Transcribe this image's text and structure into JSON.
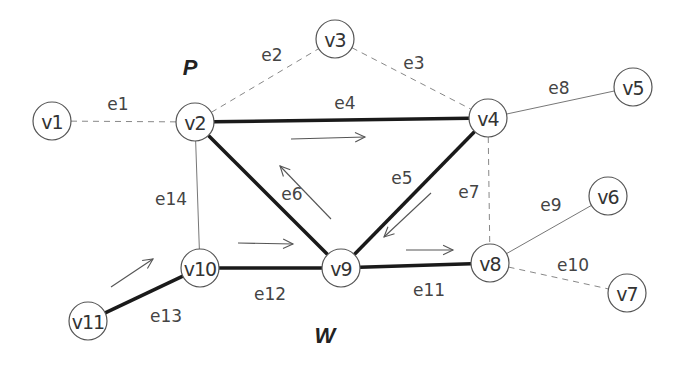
{
  "diagram": {
    "regions": [
      {
        "label": "P",
        "x": 190,
        "y": 67
      },
      {
        "label": "W",
        "x": 325,
        "y": 335
      }
    ],
    "nodes": [
      {
        "id": "v1",
        "label": "v1",
        "x": 52,
        "y": 121
      },
      {
        "id": "v2",
        "label": "v2",
        "x": 195,
        "y": 122
      },
      {
        "id": "v3",
        "label": "v3",
        "x": 335,
        "y": 39
      },
      {
        "id": "v4",
        "label": "v4",
        "x": 488,
        "y": 118
      },
      {
        "id": "v5",
        "label": "v5",
        "x": 633,
        "y": 87
      },
      {
        "id": "v6",
        "label": "v6",
        "x": 608,
        "y": 196
      },
      {
        "id": "v7",
        "label": "v7",
        "x": 627,
        "y": 293
      },
      {
        "id": "v8",
        "label": "v8",
        "x": 490,
        "y": 263
      },
      {
        "id": "v9",
        "label": "v9",
        "x": 341,
        "y": 268
      },
      {
        "id": "v10",
        "label": "v10",
        "x": 200,
        "y": 268
      },
      {
        "id": "v11",
        "label": "v11",
        "x": 88,
        "y": 321
      }
    ],
    "edges": [
      {
        "id": "e1",
        "label": "e1",
        "from": "v1",
        "to": "v2",
        "style": "dashed",
        "lx": 118,
        "ly": 104
      },
      {
        "id": "e2",
        "label": "e2",
        "from": "v2",
        "to": "v3",
        "style": "dashed",
        "lx": 272,
        "ly": 55
      },
      {
        "id": "e3",
        "label": "e3",
        "from": "v3",
        "to": "v4",
        "style": "dashed",
        "lx": 414,
        "ly": 63
      },
      {
        "id": "e4",
        "label": "e4",
        "from": "v2",
        "to": "v4",
        "style": "thick",
        "lx": 345,
        "ly": 103
      },
      {
        "id": "e5",
        "label": "e5",
        "from": "v4",
        "to": "v9",
        "style": "thick",
        "lx": 402,
        "ly": 178
      },
      {
        "id": "e6",
        "label": "e6",
        "from": "v2",
        "to": "v9",
        "style": "thick",
        "lx": 292,
        "ly": 194
      },
      {
        "id": "e7",
        "label": "e7",
        "from": "v4",
        "to": "v8",
        "style": "dashed",
        "lx": 469,
        "ly": 192
      },
      {
        "id": "e8",
        "label": "e8",
        "from": "v4",
        "to": "v5",
        "style": "thin",
        "lx": 559,
        "ly": 88
      },
      {
        "id": "e9",
        "label": "e9",
        "from": "v8",
        "to": "v6",
        "style": "thin",
        "lx": 551,
        "ly": 205
      },
      {
        "id": "e10",
        "label": "e10",
        "from": "v8",
        "to": "v7",
        "style": "dashed",
        "lx": 573,
        "ly": 265
      },
      {
        "id": "e11",
        "label": "e11",
        "from": "v9",
        "to": "v8",
        "style": "thick",
        "lx": 429,
        "ly": 290
      },
      {
        "id": "e12",
        "label": "e12",
        "from": "v10",
        "to": "v9",
        "style": "thick",
        "lx": 270,
        "ly": 294
      },
      {
        "id": "e13",
        "label": "e13",
        "from": "v11",
        "to": "v10",
        "style": "thick",
        "lx": 166,
        "ly": 316
      },
      {
        "id": "e14",
        "label": "e14",
        "from": "v2",
        "to": "v10",
        "style": "thin",
        "lx": 171,
        "ly": 199
      }
    ],
    "direction_arrows": [
      {
        "id": "arrow-e4",
        "x1": 291,
        "y1": 139,
        "x2": 365,
        "y2": 137
      },
      {
        "id": "arrow-e6",
        "x1": 331,
        "y1": 219,
        "x2": 280,
        "y2": 166
      },
      {
        "id": "arrow-e5",
        "x1": 431,
        "y1": 193,
        "x2": 384,
        "y2": 237
      },
      {
        "id": "arrow-e12",
        "x1": 238,
        "y1": 243,
        "x2": 293,
        "y2": 244
      },
      {
        "id": "arrow-e11",
        "x1": 406,
        "y1": 250,
        "x2": 453,
        "y2": 250
      },
      {
        "id": "arrow-e13",
        "x1": 111,
        "y1": 287,
        "x2": 153,
        "y2": 259
      }
    ]
  }
}
